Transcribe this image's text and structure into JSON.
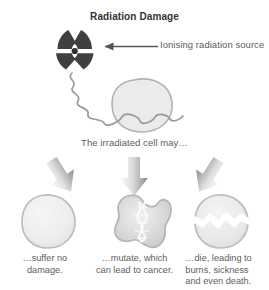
{
  "page": {
    "cut_off_top_text": "r cell mutations.",
    "title": "Radiation Damage",
    "source_label": "Ionising radiation source",
    "middle_label": "The irradiated cell may…"
  },
  "outcomes": [
    {
      "id": "no-damage",
      "caption": "…suffer no\ndamage.",
      "caption_lines": [
        "…suffer no",
        "damage."
      ],
      "cell_icon": "healthy-cell",
      "arrow_icon": "arrow-down-left"
    },
    {
      "id": "mutate",
      "caption": "…mutate, which\ncan lead to cancer.",
      "caption_lines": [
        "…mutate, which",
        "can lead to cancer."
      ],
      "cell_icon": "mutated-cell-dna",
      "arrow_icon": "arrow-down"
    },
    {
      "id": "die",
      "caption": "…die, leading to\nburns, sickness\nand even death.",
      "caption_lines": [
        "…die, leading to",
        "burns, sickness",
        "and even death."
      ],
      "cell_icon": "dying-cell-cracked",
      "arrow_icon": "arrow-down-right"
    }
  ],
  "icons": {
    "radiation_trefoil": "radiation-trefoil-icon",
    "ray": "wavy-radiation-ray-icon",
    "pointer": "arrow-left-icon",
    "irradiated_cell": "irradiated-cell-icon"
  },
  "colors": {
    "background": "#ffffff",
    "title_text": "#333333",
    "body_text": "#5d5d5d",
    "trefoil_dark": "#3f3f3f",
    "cell_outline": "#b0b0b0",
    "cell_fill_light": "#ececec",
    "cell_fill_mid": "#d8d8d8",
    "ray_stroke": "#9a9a9a",
    "arrow_light": "#fbfbfb",
    "arrow_dark": "#8e8e8e",
    "pointer_line": "#555555"
  }
}
